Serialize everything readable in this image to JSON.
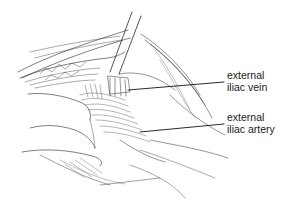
{
  "figure": {
    "kind": "surgical anatomical line illustration",
    "background": "#ffffff",
    "ink_color": "#2a2a2a",
    "labels": [
      {
        "line1": "external",
        "line2": "iliac vein",
        "x": 227,
        "y": 69,
        "pointer_from": [
          224,
          82
        ],
        "pointer_to": [
          128,
          90
        ]
      },
      {
        "line1": "external",
        "line2": "iliac artery",
        "x": 227,
        "y": 111,
        "pointer_from": [
          224,
          124
        ],
        "pointer_to": [
          140,
          132
        ]
      }
    ]
  }
}
